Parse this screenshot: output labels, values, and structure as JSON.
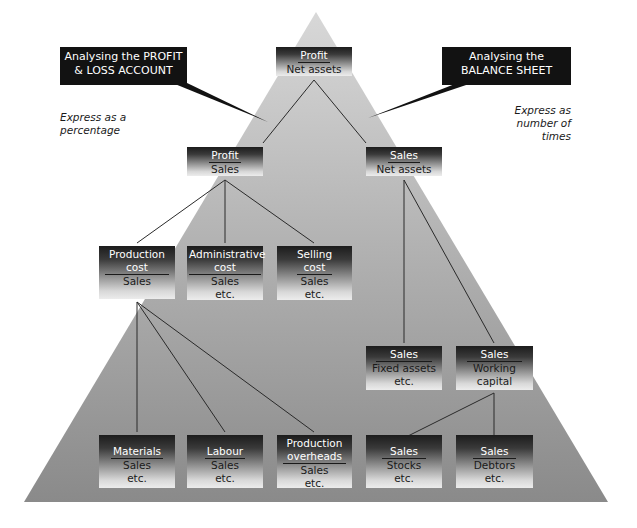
{
  "diagram": {
    "type": "pyramid-ratio-tree",
    "colors": {
      "pyramid_top": "#d6d6d6",
      "pyramid_bottom": "#8c8c8c",
      "callout_bg": "#121212",
      "callout_text": "#ffffff",
      "line": "#2a2a2a"
    },
    "callouts": {
      "left": {
        "line1": "Analysing the PROFIT",
        "line2": "& LOSS ACCOUNT"
      },
      "right": {
        "line1": "Analysing the",
        "line2": "BALANCE SHEET"
      }
    },
    "notes": {
      "left": {
        "line1": "Express as a",
        "line2": "percentage"
      },
      "right": {
        "line1": "Express as",
        "line2": "number of",
        "line3": "times"
      }
    },
    "nodes": {
      "root": {
        "numerator": "Profit",
        "denominator": "Net assets"
      },
      "profit_sales": {
        "numerator": "Profit",
        "denominator": "Sales"
      },
      "sales_net_assets": {
        "numerator": "Sales",
        "denominator": "Net assets"
      },
      "production_cost": {
        "numerator_line1": "Production",
        "numerator_line2": "cost",
        "denominator": "Sales"
      },
      "administrative_cost": {
        "numerator_line1": "Administrative",
        "numerator_line2": "cost",
        "denominator": "Sales",
        "extra": "etc."
      },
      "selling_cost": {
        "numerator_line1": "Selling",
        "numerator_line2": "cost",
        "denominator": "Sales",
        "extra": "etc."
      },
      "fixed_assets": {
        "numerator": "Sales",
        "denominator": "Fixed assets",
        "extra": "etc."
      },
      "working_capital": {
        "numerator": "Sales",
        "denominator_line1": "Working",
        "denominator_line2": "capital"
      },
      "materials": {
        "numerator": "Materials",
        "denominator": "Sales",
        "extra": "etc."
      },
      "labour": {
        "numerator": "Labour",
        "denominator": "Sales",
        "extra": "etc."
      },
      "production_overheads": {
        "numerator_line1": "Production",
        "numerator_line2": "overheads",
        "denominator": "Sales",
        "extra": "etc."
      },
      "stocks": {
        "numerator": "Sales",
        "denominator": "Stocks",
        "extra": "etc."
      },
      "debtors": {
        "numerator": "Sales",
        "denominator": "Debtors",
        "extra": "etc."
      }
    },
    "edges": [
      [
        "root",
        "profit_sales"
      ],
      [
        "root",
        "sales_net_assets"
      ],
      [
        "profit_sales",
        "production_cost"
      ],
      [
        "profit_sales",
        "administrative_cost"
      ],
      [
        "profit_sales",
        "selling_cost"
      ],
      [
        "sales_net_assets",
        "fixed_assets"
      ],
      [
        "sales_net_assets",
        "working_capital"
      ],
      [
        "production_cost",
        "materials"
      ],
      [
        "production_cost",
        "labour"
      ],
      [
        "production_cost",
        "production_overheads"
      ],
      [
        "working_capital",
        "stocks"
      ],
      [
        "working_capital",
        "debtors"
      ]
    ]
  }
}
